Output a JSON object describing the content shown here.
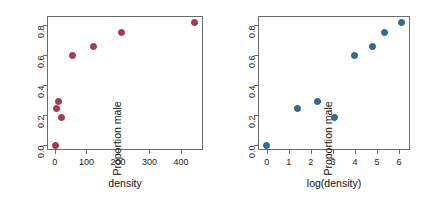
{
  "figure": {
    "panels": [
      {
        "id": "density-panel",
        "xlabel": "density",
        "ylabel": "Proportion male",
        "point_color": "#b03a52",
        "point_edge": "#8d2b40",
        "xticks": [
          "0",
          "100",
          "200",
          "300",
          "400"
        ],
        "yticks": [
          "0.0",
          "0.2",
          "0.4",
          "0.6",
          "0.8"
        ]
      },
      {
        "id": "logdensity-panel",
        "xlabel": "log(density)",
        "ylabel": "Proportion male",
        "point_color": "#2f6f9f",
        "point_edge": "#245779",
        "xticks": [
          "0",
          "1",
          "2",
          "3",
          "4",
          "5",
          "6"
        ],
        "yticks": [
          "0.0",
          "0.2",
          "0.4",
          "0.6",
          "0.8"
        ]
      }
    ]
  },
  "chart_data": [
    {
      "type": "scatter",
      "title": "",
      "xlabel": "density",
      "ylabel": "Proportion male",
      "xlim": [
        -25,
        470
      ],
      "ylim": [
        -0.03,
        0.86
      ],
      "xticks": [
        0,
        100,
        200,
        300,
        400
      ],
      "yticks": [
        0.0,
        0.2,
        0.4,
        0.6,
        0.8
      ],
      "grid": false,
      "legend": "none",
      "marker_color": "#b03a52",
      "series": [
        {
          "name": "Proportion male vs density",
          "x": [
            1,
            4,
            10,
            22,
            55,
            121,
            210,
            444
          ],
          "y": [
            0.0,
            0.245,
            0.295,
            0.185,
            0.6,
            0.66,
            0.75,
            0.82
          ]
        }
      ]
    },
    {
      "type": "scatter",
      "title": "",
      "xlabel": "log(density)",
      "ylabel": "Proportion male",
      "xlim": [
        -0.4,
        6.5
      ],
      "ylim": [
        -0.03,
        0.86
      ],
      "xticks": [
        0,
        1,
        2,
        3,
        4,
        5,
        6
      ],
      "yticks": [
        0.0,
        0.2,
        0.4,
        0.6,
        0.8
      ],
      "grid": false,
      "legend": "none",
      "marker_color": "#2f6f9f",
      "series": [
        {
          "name": "Proportion male vs log(density)",
          "x": [
            0.0,
            1.39,
            2.3,
            3.09,
            4.0,
            4.8,
            5.35,
            6.1
          ],
          "y": [
            0.0,
            0.245,
            0.295,
            0.185,
            0.6,
            0.66,
            0.75,
            0.82
          ]
        }
      ]
    }
  ]
}
